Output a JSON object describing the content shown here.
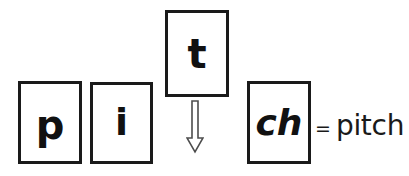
{
  "diagram": {
    "type": "phoneme-blending",
    "tiles": [
      {
        "id": "p",
        "label": "p",
        "position": "bottom-row-1"
      },
      {
        "id": "i",
        "label": "i",
        "position": "bottom-row-2"
      },
      {
        "id": "t",
        "label": "t",
        "position": "raised-top"
      },
      {
        "id": "ch",
        "label": "ch",
        "position": "bottom-row-3"
      }
    ],
    "arrow": {
      "name": "down-arrow",
      "direction": "down",
      "style": "hollow-outline",
      "from_tile": "t",
      "to_tile": "ch"
    },
    "equation": {
      "equals": "=",
      "result": "pitch"
    },
    "colors": {
      "background": "#ffffff",
      "stroke": "#1a1a1a",
      "text": "#111111",
      "arrow_fill": "#ffffff",
      "arrow_stroke": "#4d4d4d"
    }
  }
}
